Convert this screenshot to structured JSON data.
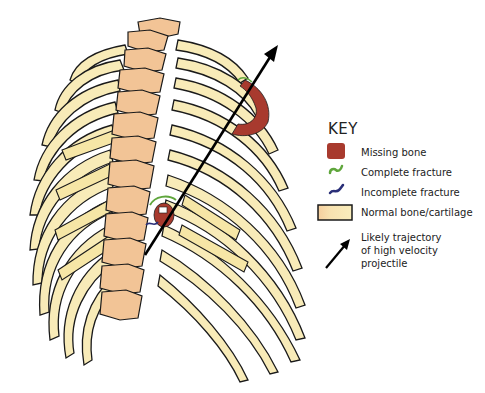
{
  "figure": {
    "colors": {
      "bone": "#f8ebb8",
      "bone_shade": "#f4dea0",
      "vertebra": "#f2c496",
      "outline": "#1a1a1a",
      "missing_bone": "#a83a2e",
      "complete_fracture": "#5fa63c",
      "incomplete_fracture": "#2a2f78",
      "arrow": "#000000"
    }
  },
  "key": {
    "title": "KEY",
    "items": [
      {
        "label": "Missing bone",
        "icon": "red-square-swatch"
      },
      {
        "label": "Complete fracture",
        "icon": "green-squiggle"
      },
      {
        "label": "Incomplete fracture",
        "icon": "blue-squiggle"
      },
      {
        "label": "Normal bone/cartilage",
        "icon": "bone-gradient-swatch"
      },
      {
        "label_lines": [
          "Likely trajectory",
          "of high velocity",
          "projectile"
        ],
        "icon": "black-arrow"
      }
    ]
  }
}
